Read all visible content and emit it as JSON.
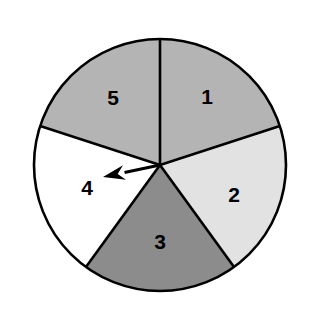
{
  "figure": {
    "background_color": "#ffffff",
    "outline_color": "#000000"
  },
  "chart_data": {
    "type": "pie",
    "title": "",
    "subtitle": "",
    "xlabel": "",
    "ylabel": "",
    "legend": "none",
    "grid": false,
    "categories": [
      "1",
      "2",
      "3",
      "4",
      "5"
    ],
    "values": [
      72,
      72,
      72,
      72,
      72
    ],
    "units": "degrees",
    "start_angle_deg": 0,
    "direction": "clockwise",
    "annotations": [
      {
        "name": "spinner-arrow",
        "points_to": "4",
        "angle_deg": 252
      }
    ]
  },
  "pie": {
    "center_x": 160,
    "center_y": 165,
    "radius": 126,
    "stroke_width": 2.6,
    "slices": [
      {
        "id": "slice-1",
        "label": "1",
        "color": "#b4b4b4",
        "start_deg": 0,
        "end_deg": 72,
        "label_x": 207,
        "label_y": 98
      },
      {
        "id": "slice-2",
        "label": "2",
        "color": "#e2e2e2",
        "start_deg": 72,
        "end_deg": 144,
        "label_x": 234,
        "label_y": 196
      },
      {
        "id": "slice-3",
        "label": "3",
        "color": "#8c8c8c",
        "start_deg": 144,
        "end_deg": 216,
        "label_x": 160,
        "label_y": 243
      },
      {
        "id": "slice-4",
        "label": "4",
        "color": "#ffffff",
        "start_deg": 216,
        "end_deg": 288,
        "label_x": 87,
        "label_y": 189
      },
      {
        "id": "slice-5",
        "label": "5",
        "color": "#b4b4b4",
        "start_deg": 288,
        "end_deg": 360,
        "label_x": 113,
        "label_y": 99
      }
    ]
  },
  "arrow": {
    "color": "#000000",
    "tail_x": 160,
    "tail_y": 165,
    "tip_x": 103,
    "tip_y": 177,
    "shaft_width": 3.2,
    "head_length": 22,
    "head_width": 15
  }
}
